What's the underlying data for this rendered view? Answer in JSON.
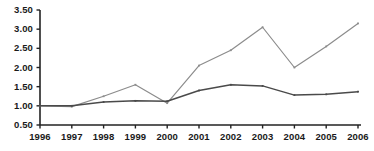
{
  "chart_data": {
    "type": "line",
    "title": "",
    "subtitle": "",
    "xlabel": "",
    "ylabel": "",
    "categories": [
      "1996",
      "1997",
      "1998",
      "1999",
      "2000",
      "2001",
      "2002",
      "2003",
      "2004",
      "2005",
      "2006"
    ],
    "series": [
      {
        "name": "upper-series",
        "color": "#8c8c8c",
        "values": [
          1.0,
          0.98,
          1.25,
          1.55,
          1.07,
          2.05,
          2.45,
          3.05,
          2.0,
          2.55,
          3.15
        ]
      },
      {
        "name": "lower-series",
        "color": "#4a4a4a",
        "values": [
          1.0,
          1.0,
          1.1,
          1.13,
          1.12,
          1.4,
          1.55,
          1.52,
          1.28,
          1.3,
          1.37
        ]
      }
    ],
    "ylim": [
      0.5,
      3.5
    ],
    "yticks": [
      0.5,
      1.0,
      1.5,
      2.0,
      2.5,
      3.0,
      3.5
    ],
    "ytick_labels": [
      "0.50",
      "1.00",
      "1.50",
      "2.00",
      "2.50",
      "3.00",
      "3.50"
    ],
    "grid": false,
    "legend": "none",
    "axis_color": "#222222"
  },
  "caption": {
    "cut_off_text": ""
  }
}
